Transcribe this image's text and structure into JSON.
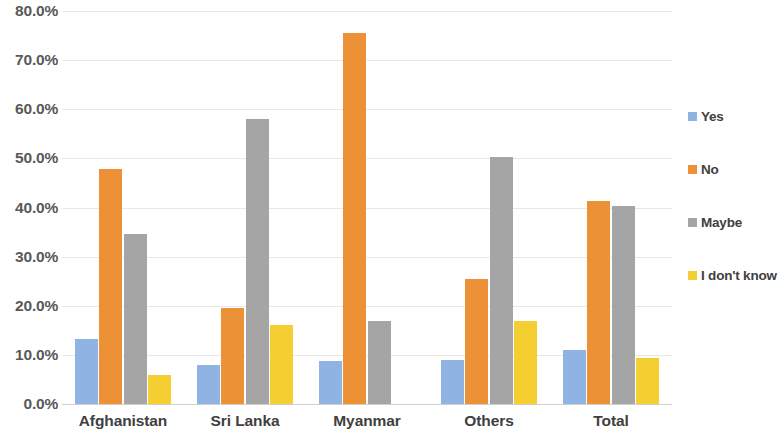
{
  "chart_data": {
    "type": "bar",
    "title": "",
    "xlabel": "",
    "ylabel": "",
    "ylim": [
      0,
      80
    ],
    "y_tick_step": 10,
    "grid": true,
    "legend_position": "right",
    "y_tick_labels": [
      "80.0%",
      "70.0%",
      "60.0%",
      "50.0%",
      "40.0%",
      "30.0%",
      "20.0%",
      "10.0%",
      "0.0%"
    ],
    "y_tick_values": [
      80,
      70,
      60,
      50,
      40,
      30,
      20,
      10,
      0
    ],
    "categories": [
      "Afghanistan",
      "Sri Lanka",
      "Myanmar",
      "Others",
      "Total"
    ],
    "series": [
      {
        "name": "Yes",
        "color": "#8FB4E3",
        "values": [
          13.2,
          8.0,
          8.8,
          9.0,
          11.0
        ]
      },
      {
        "name": "No",
        "color": "#ED9137",
        "values": [
          47.8,
          19.5,
          75.5,
          25.4,
          41.4
        ]
      },
      {
        "name": "Maybe",
        "color": "#A5A5A5",
        "values": [
          34.7,
          58.0,
          16.9,
          50.3,
          40.4
        ]
      },
      {
        "name": "I don't know",
        "color": "#F5CE32",
        "values": [
          6.0,
          16.0,
          0.0,
          17.0,
          9.3
        ]
      }
    ]
  },
  "colors": {
    "yes": "#8FB4E3",
    "no": "#ED9137",
    "maybe": "#A5A5A5",
    "i_dont_know": "#F5CE32",
    "gridline": "#E8E8E8",
    "axis_text": "#595959",
    "background": "#FFFFFF"
  }
}
